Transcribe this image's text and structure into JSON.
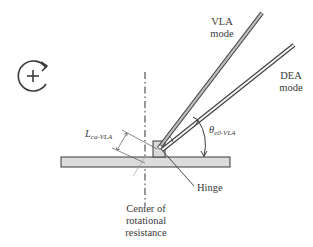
{
  "diagram": {
    "labels": {
      "vla_mode_line1": "VLA",
      "vla_mode_line2": "mode",
      "dea_mode_line1": "DEA",
      "dea_mode_line2": "mode",
      "length_symbol": "L",
      "length_subscript": "ca-VLA",
      "angle_symbol": "θ",
      "angle_subscript": "e0-VLA",
      "hinge": "Hinge",
      "center_line1": "Center of",
      "center_line2": "rotational",
      "center_line3": "resistance"
    },
    "icons": {
      "rotation": "clockwise-rotation-plus-icon"
    },
    "colors": {
      "stroke": "#3a3a3a",
      "rod_fill": "#c8c8c8",
      "plate_fill": "#dcdcdc",
      "hinge_fill": "#d9d9d9"
    }
  }
}
